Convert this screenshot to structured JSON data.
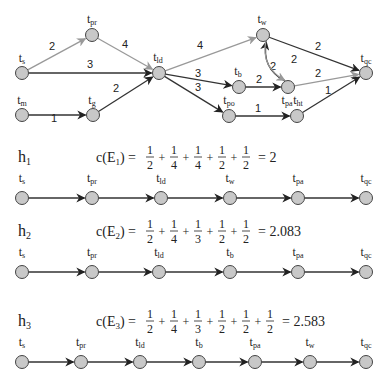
{
  "graph": {
    "nodes": [
      {
        "id": "ts",
        "base": "t",
        "sub": "s",
        "x": 22,
        "y": 73,
        "lx": 22,
        "ly": 62
      },
      {
        "id": "tpr",
        "base": "t",
        "sub": "pr",
        "x": 92,
        "y": 35,
        "lx": 92,
        "ly": 23
      },
      {
        "id": "tld",
        "base": "t",
        "sub": "ld",
        "x": 159,
        "y": 73,
        "lx": 158,
        "ly": 61
      },
      {
        "id": "tm",
        "base": "t",
        "sub": "m",
        "x": 22,
        "y": 115,
        "lx": 22,
        "ly": 104
      },
      {
        "id": "tg",
        "base": "t",
        "sub": "g",
        "x": 93,
        "y": 115,
        "lx": 92,
        "ly": 104
      },
      {
        "id": "tw",
        "base": "t",
        "sub": "w",
        "x": 263,
        "y": 35,
        "lx": 262,
        "ly": 23
      },
      {
        "id": "tb",
        "base": "t",
        "sub": "b",
        "x": 239,
        "y": 87,
        "lx": 238,
        "ly": 75
      },
      {
        "id": "tpa",
        "base": "t",
        "sub": "pa",
        "x": 288,
        "y": 87,
        "lx": 287,
        "ly": 104
      },
      {
        "id": "tpo",
        "base": "t",
        "sub": "po",
        "x": 229,
        "y": 116,
        "lx": 229,
        "ly": 104
      },
      {
        "id": "tht",
        "base": "t",
        "sub": "ht",
        "x": 297,
        "y": 116,
        "lx": 298,
        "ly": 104
      },
      {
        "id": "tqc",
        "base": "t",
        "sub": "qc",
        "x": 366,
        "y": 73,
        "lx": 366,
        "ly": 62
      }
    ],
    "edges": [
      {
        "from": "ts",
        "to": "tpr",
        "weight": "2",
        "color": "#999999",
        "wx": 52,
        "wy": 50
      },
      {
        "from": "tpr",
        "to": "tld",
        "weight": "4",
        "color": "#999999",
        "wx": 125,
        "wy": 48
      },
      {
        "from": "ts",
        "to": "tld",
        "weight": "3",
        "color": "#333333",
        "wx": 90,
        "wy": 68
      },
      {
        "from": "tm",
        "to": "tg",
        "weight": "1",
        "color": "#333333",
        "wx": 54,
        "wy": 122
      },
      {
        "from": "tg",
        "to": "tld",
        "weight": "2",
        "color": "#333333",
        "wx": 116,
        "wy": 92
      },
      {
        "from": "tld",
        "to": "tw",
        "weight": "4",
        "color": "#999999",
        "wx": 200,
        "wy": 49
      },
      {
        "from": "tld",
        "to": "tb",
        "weight": "3",
        "color": "#333333",
        "wx": 198,
        "wy": 77
      },
      {
        "from": "tld",
        "to": "tpo",
        "weight": "3",
        "color": "#333333",
        "wx": 198,
        "wy": 91
      },
      {
        "from": "tb",
        "to": "tpa",
        "weight": "2",
        "color": "#333333",
        "wx": 259,
        "wy": 83
      },
      {
        "from": "tpo",
        "to": "tht",
        "weight": "1",
        "color": "#333333",
        "wx": 258,
        "wy": 112
      },
      {
        "from": "tw",
        "to": "tqc",
        "weight": "2",
        "color": "#333333",
        "wx": 318,
        "wy": 50
      },
      {
        "from": "tpa",
        "to": "tw",
        "weight": "2",
        "color": "#222222",
        "wx": 273,
        "wy": 70,
        "curve": "left"
      },
      {
        "from": "tw",
        "to": "tpa",
        "weight": "2",
        "color": "#999999",
        "wx": 294,
        "wy": 63,
        "curve": "right"
      },
      {
        "from": "tpa",
        "to": "tqc",
        "weight": "2",
        "color": "#999999",
        "wx": 318,
        "wy": 77
      },
      {
        "from": "tht",
        "to": "tqc",
        "weight": "1",
        "color": "#333333",
        "wx": 328,
        "wy": 94
      }
    ]
  },
  "heuristics": [
    {
      "name": "h",
      "index": "1",
      "cost_label": "c(E",
      "cost_index": "1",
      "cost_close": ")",
      "fractions": [
        [
          "1",
          "2"
        ],
        [
          "1",
          "4"
        ],
        [
          "1",
          "4"
        ],
        [
          "1",
          "2"
        ],
        [
          "1",
          "2"
        ]
      ],
      "result": "2",
      "row_y": 198,
      "label_y": 182,
      "eq_y": 157,
      "path": [
        {
          "sub": "s",
          "x": 22
        },
        {
          "sub": "pr",
          "x": 92
        },
        {
          "sub": "ld",
          "x": 161
        },
        {
          "sub": "w",
          "x": 230
        },
        {
          "sub": "pa",
          "x": 298
        },
        {
          "sub": "qc",
          "x": 366
        }
      ]
    },
    {
      "name": "h",
      "index": "2",
      "cost_label": "c(E",
      "cost_index": "2",
      "cost_close": ")",
      "fractions": [
        [
          "1",
          "2"
        ],
        [
          "1",
          "4"
        ],
        [
          "1",
          "3"
        ],
        [
          "1",
          "2"
        ],
        [
          "1",
          "2"
        ]
      ],
      "result": "2.083",
      "row_y": 272,
      "label_y": 256,
      "eq_y": 231,
      "path": [
        {
          "sub": "s",
          "x": 22
        },
        {
          "sub": "pr",
          "x": 92
        },
        {
          "sub": "ld",
          "x": 159
        },
        {
          "sub": "b",
          "x": 230
        },
        {
          "sub": "pa",
          "x": 298
        },
        {
          "sub": "qc",
          "x": 366
        }
      ]
    },
    {
      "name": "h",
      "index": "3",
      "cost_label": "c(E",
      "cost_index": "3",
      "cost_close": ")",
      "fractions": [
        [
          "1",
          "2"
        ],
        [
          "1",
          "4"
        ],
        [
          "1",
          "3"
        ],
        [
          "1",
          "2"
        ],
        [
          "1",
          "2"
        ],
        [
          "1",
          "2"
        ]
      ],
      "result": "2.583",
      "row_y": 362,
      "label_y": 346,
      "eq_y": 321,
      "path": [
        {
          "sub": "s",
          "x": 22
        },
        {
          "sub": "pr",
          "x": 81
        },
        {
          "sub": "ld",
          "x": 140
        },
        {
          "sub": "b",
          "x": 199
        },
        {
          "sub": "pa",
          "x": 255
        },
        {
          "sub": "w",
          "x": 310
        },
        {
          "sub": "qc",
          "x": 366
        }
      ]
    }
  ],
  "colors": {
    "node_fill": "#c8c8c8",
    "node_stroke": "#444444",
    "edge_dark": "#333333",
    "edge_light": "#999999"
  }
}
